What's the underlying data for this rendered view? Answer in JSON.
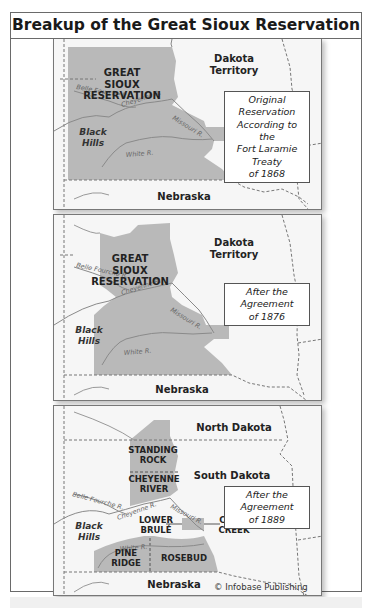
{
  "title": "Breakup of the Great Sioux Reservation",
  "colors": {
    "reservation": "#b9b9b9",
    "land": "#f6f6f6",
    "border": "#777777",
    "river": "#8a8a8a"
  },
  "panels": [
    {
      "caption": "Original Reservation According to the Fort Laramie Treaty of 1868",
      "caption_lines": [
        "Original Reservation",
        "According to the",
        "Fort Laramie Treaty",
        "of 1868"
      ],
      "reservation_label": [
        "GREAT",
        "SIOUX",
        "RESERVATION"
      ],
      "territory_label": [
        "Dakota",
        "Territory"
      ],
      "south_label": "Nebraska",
      "hills_label": [
        "Black",
        "Hills"
      ],
      "rivers": [
        "Belle Fourche R.",
        "Cheyenne R.",
        "Missouri R.",
        "White R."
      ]
    },
    {
      "caption": "After the Agreement of 1876",
      "caption_lines": [
        "After the Agreement",
        "of 1876"
      ],
      "reservation_label": [
        "GREAT",
        "SIOUX",
        "RESERVATION"
      ],
      "territory_label": [
        "Dakota",
        "Territory"
      ],
      "south_label": "Nebraska",
      "hills_label": [
        "Black",
        "Hills"
      ],
      "rivers": [
        "Belle Fourche R.",
        "Cheyenne R.",
        "Missouri R.",
        "White R."
      ]
    },
    {
      "caption": "After the Agreement of 1889",
      "caption_lines": [
        "After the Agreement",
        "of 1889"
      ],
      "north_label": "North Dakota",
      "state_label": "South Dakota",
      "south_label": "Nebraska",
      "hills_label": [
        "Black",
        "Hills"
      ],
      "reservations": [
        {
          "name": [
            "STANDING",
            "ROCK"
          ]
        },
        {
          "name": [
            "CHEYENNE",
            "RIVER"
          ]
        },
        {
          "name": [
            "LOWER",
            "BRULÉ"
          ]
        },
        {
          "name": [
            "CROW",
            "CREEK"
          ]
        },
        {
          "name": [
            "PINE",
            "RIDGE"
          ]
        },
        {
          "name": [
            "ROSEBUD"
          ]
        }
      ],
      "rivers": [
        "Belle Fourche R.",
        "Cheyenne R.",
        "Missouri R.",
        "White R."
      ],
      "credit": "© Infobase Publishing"
    }
  ]
}
